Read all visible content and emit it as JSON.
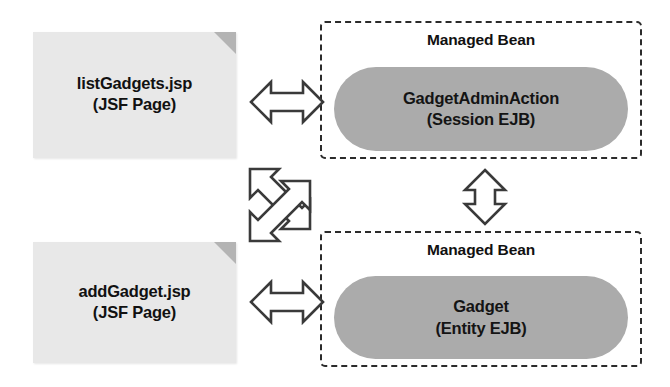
{
  "diagram": {
    "colors": {
      "page_fill": "#e8e8e8",
      "page_fold": "#b4b4b4",
      "bean_fill": "#ababab",
      "dashed_border": "#2b2b2b",
      "arrow_stroke": "#3a3a3a",
      "arrow_fill": "#ffffff",
      "text": "#111111",
      "background": "#ffffff"
    },
    "nodes": {
      "list_page": {
        "type": "jsp-document",
        "line1": "listGadgets.jsp",
        "line2": "(JSF Page)"
      },
      "add_page": {
        "type": "jsp-document",
        "line1": "addGadget.jsp",
        "line2": "(JSF Page)"
      },
      "session_bean": {
        "type": "managed-bean",
        "container_label": "Managed Bean",
        "line1": "GadgetAdminAction",
        "line2": "(Session EJB)"
      },
      "entity_bean": {
        "type": "managed-bean",
        "container_label": "Managed Bean",
        "line1": "Gadget",
        "line2": "(Entity EJB)"
      }
    },
    "connectors": [
      {
        "name": "list-page-to-session-bean",
        "style": "double-headed-horizontal",
        "from": "listGadgets.jsp",
        "to": "GadgetAdminAction"
      },
      {
        "name": "add-page-to-entity-bean",
        "style": "double-headed-horizontal",
        "from": "addGadget.jsp",
        "to": "Gadget"
      },
      {
        "name": "session-bean-to-entity-bean",
        "style": "double-headed-vertical",
        "from": "GadgetAdminAction",
        "to": "Gadget"
      },
      {
        "name": "cross-page-bean-links",
        "style": "crossed-diagonal-double-headed",
        "from": "listGadgets.jsp / addGadget.jsp",
        "to": "Gadget / GadgetAdminAction"
      }
    ]
  }
}
